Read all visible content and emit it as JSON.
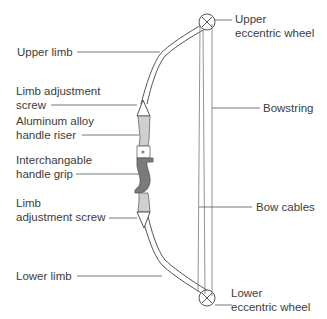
{
  "diagram": {
    "labels": {
      "upper_limb": "Upper limb",
      "limb_adjustment_screw_top_1": "Limb adjustment",
      "limb_adjustment_screw_top_2": "screw",
      "handle_riser_1": "Aluminum alloy",
      "handle_riser_2": "handle riser",
      "handle_grip_1": "Interchangable",
      "handle_grip_2": "handle grip",
      "limb_adjustment_screw_bottom_1": "Limb",
      "limb_adjustment_screw_bottom_2": "adjustment screw",
      "lower_limb": "Lower limb",
      "upper_wheel_1": "Upper",
      "upper_wheel_2": "eccentric wheel",
      "bowstring": "Bowstring",
      "bow_cables": "Bow cables",
      "lower_wheel_1": "Lower",
      "lower_wheel_2": "eccentric wheel"
    },
    "colors": {
      "line": "#555555",
      "riser_fill": "#c8c8c8",
      "grip_fill": "#7a7a7a",
      "text": "#3c3c3c"
    }
  }
}
